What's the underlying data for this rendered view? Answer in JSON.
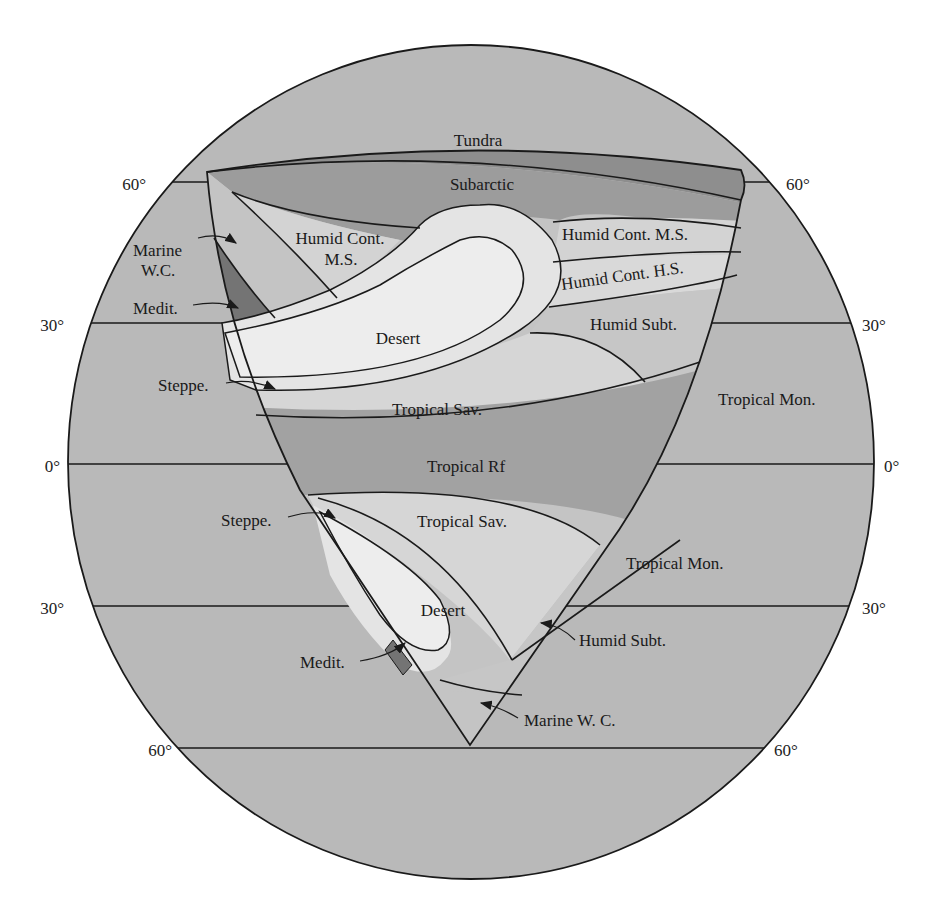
{
  "diagram": {
    "colors": {
      "ocean": "#b9b9b9",
      "tundra": "#8e8e8e",
      "subarctic": "#9c9c9c",
      "humid_cont": "#d3d3d3",
      "desert": "#ececec",
      "steppe": "#e0e0e0",
      "tropical_sav": "#d6d6d6",
      "tropical_rf": "#a2a2a2",
      "tropical_mon": "#bdbdbd",
      "humid_subt": "#c6c6c6",
      "marine": "#c4c4c4",
      "medit": "#747474"
    },
    "latitudes": {
      "left": [
        "60°",
        "30°",
        "0°",
        "30°",
        "60°"
      ],
      "right": [
        "60°",
        "30°",
        "0°",
        "30°",
        "60°"
      ]
    },
    "labels": {
      "tundra": "Tundra",
      "subarctic": "Subarctic",
      "humid_cont_ms_west_1": "Humid Cont.",
      "humid_cont_ms_west_2": "M.S.",
      "humid_cont_ms_east": "Humid Cont. M.S.",
      "humid_cont_hs": "Humid Cont. H.S.",
      "marine_wc_1": "Marine",
      "marine_wc_2": "W.C.",
      "medit_n": "Medit.",
      "desert_n": "Desert",
      "humid_subt_n": "Humid Subt.",
      "steppe_n": "Steppe.",
      "tropical_sav_n": "Tropical Sav.",
      "tropical_mon_n": "Tropical Mon.",
      "tropical_rf": "Tropical Rf",
      "steppe_s": "Steppe.",
      "tropical_sav_s": "Tropical Sav.",
      "tropical_mon_s": "Tropical Mon.",
      "desert_s": "Desert",
      "humid_subt_s": "Humid Subt.",
      "medit_s": "Medit.",
      "marine_wc_s": "Marine W. C."
    }
  }
}
